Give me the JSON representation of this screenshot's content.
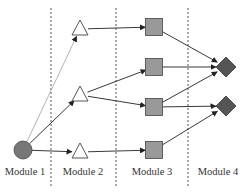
{
  "diagram": {
    "modules": [
      {
        "label": "Module 1",
        "x": 25
      },
      {
        "label": "Module 2",
        "x": 83
      },
      {
        "label": "Module 3",
        "x": 152
      },
      {
        "label": "Module 4",
        "x": 218
      }
    ],
    "dividers_x": [
      51,
      116,
      188
    ],
    "nodes": [
      {
        "id": "C1",
        "shape": "circle",
        "module": 1,
        "x": 23,
        "y": 150
      },
      {
        "id": "T1",
        "shape": "triangle",
        "module": 2,
        "x": 80,
        "y": 29
      },
      {
        "id": "T2",
        "shape": "triangle",
        "module": 2,
        "x": 80,
        "y": 95
      },
      {
        "id": "T3",
        "shape": "triangle",
        "module": 2,
        "x": 80,
        "y": 152
      },
      {
        "id": "S1",
        "shape": "square",
        "module": 3,
        "x": 154,
        "y": 27
      },
      {
        "id": "S2",
        "shape": "square",
        "module": 3,
        "x": 154,
        "y": 67
      },
      {
        "id": "S3",
        "shape": "square",
        "module": 3,
        "x": 154,
        "y": 107
      },
      {
        "id": "S4",
        "shape": "square",
        "module": 3,
        "x": 154,
        "y": 150
      },
      {
        "id": "D1",
        "shape": "diamond",
        "module": 4,
        "x": 226,
        "y": 67
      },
      {
        "id": "D2",
        "shape": "diamond",
        "module": 4,
        "x": 226,
        "y": 106
      }
    ],
    "edges": [
      {
        "from": "C1",
        "to": "T1",
        "style": "light"
      },
      {
        "from": "C1",
        "to": "T2",
        "style": "normal"
      },
      {
        "from": "C1",
        "to": "T3",
        "style": "normal"
      },
      {
        "from": "T1",
        "to": "S1",
        "style": "normal"
      },
      {
        "from": "T2",
        "to": "S2",
        "style": "normal"
      },
      {
        "from": "T2",
        "to": "S3",
        "style": "normal"
      },
      {
        "from": "T3",
        "to": "S4",
        "style": "normal"
      },
      {
        "from": "S1",
        "to": "D1",
        "style": "normal"
      },
      {
        "from": "S2",
        "to": "D1",
        "style": "normal"
      },
      {
        "from": "S3",
        "to": "D1",
        "style": "normal"
      },
      {
        "from": "S3",
        "to": "D2",
        "style": "normal"
      },
      {
        "from": "S4",
        "to": "D2",
        "style": "normal"
      }
    ],
    "colors": {
      "circle": "#777777",
      "triangle": "#ffffff",
      "square": "#999999",
      "diamond": "#555555",
      "edge": "#222222",
      "edge_light": "#aaaaaa",
      "divider": "#555555"
    }
  }
}
